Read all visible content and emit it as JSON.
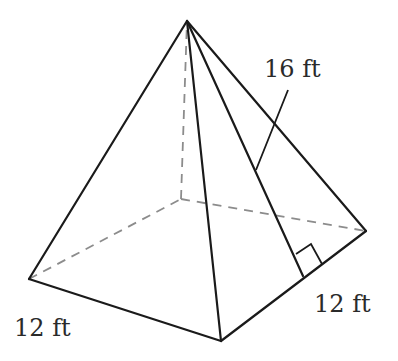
{
  "figure": {
    "type": "square-pyramid",
    "labels": {
      "slant_height": "16 ft",
      "base_left_edge": "12 ft",
      "base_right_edge": "12 ft"
    },
    "colors": {
      "edge": "#1a1a1a",
      "hidden_edge": "#8c8c8c",
      "text": "#2a2a2a",
      "background": "#ffffff"
    },
    "vertices": {
      "apex": [
        187,
        21
      ],
      "left": [
        29,
        279
      ],
      "front": [
        221,
        341
      ],
      "right": [
        366,
        231
      ],
      "back": [
        181,
        199
      ]
    },
    "slant_height_foot": [
      303,
      276
    ],
    "right_angle_marker": [
      [
        296,
        254
      ],
      [
        311,
        244
      ],
      [
        322,
        264
      ]
    ],
    "leader_line": [
      [
        288,
        90
      ],
      [
        256,
        170
      ]
    ]
  }
}
